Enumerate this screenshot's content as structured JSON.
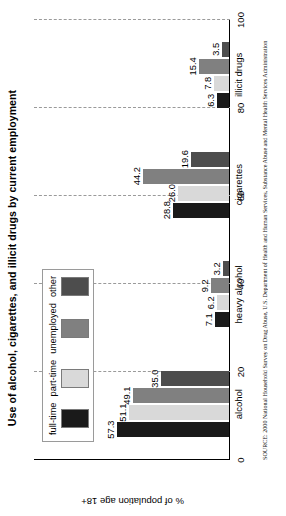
{
  "chart_data": {
    "type": "bar",
    "title": "Use of alcohol, cigarettes, and illicit drugs by current employment",
    "xlabel": "",
    "ylabel": "% of population age 18+",
    "ylim": [
      0,
      100
    ],
    "yticks": [
      "0",
      "20",
      "40",
      "60",
      "80",
      "100"
    ],
    "grid": true,
    "legend_position": "top-left-inside",
    "categories": [
      "alcohol",
      "heavy alcohol",
      "cigarettes",
      "illicit drugs"
    ],
    "series": [
      {
        "name": "full-time",
        "color": "#1a1a1a",
        "values": [
          57.3,
          7.1,
          28.8,
          6.3
        ]
      },
      {
        "name": "part-time",
        "color": "#d9d9d9",
        "values": [
          51.1,
          6.2,
          26.0,
          7.8
        ]
      },
      {
        "name": "unemployed",
        "color": "#808080",
        "values": [
          49.1,
          9.2,
          44.2,
          15.4
        ]
      },
      {
        "name": "other",
        "color": "#4d4d4d",
        "values": [
          35.0,
          3.2,
          19.6,
          3.5
        ]
      }
    ],
    "value_labels": [
      [
        "57.3",
        "51.1",
        "49.1",
        "35.0"
      ],
      [
        "7.1",
        "6.2",
        "9.2",
        "3.2"
      ],
      [
        "28.8",
        "26.0",
        "44.2",
        "19.6"
      ],
      [
        "6.3",
        "7.8",
        "15.4",
        "3.5"
      ]
    ]
  },
  "source": {
    "text": "SOURCE: 2000 National Household Survey on Drug Abuse, U.S. Department of Health and Human Services, Substance Abuse and Mental Health Services Administration"
  }
}
